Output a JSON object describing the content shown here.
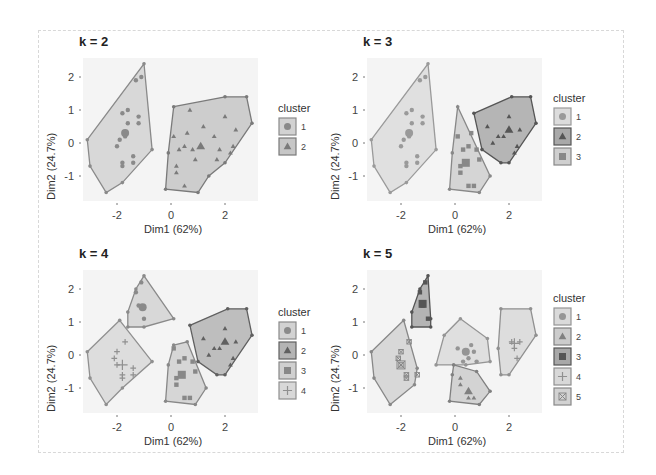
{
  "chart_data": [
    {
      "type": "scatter",
      "title": "k = 2",
      "xlabel": "Dim1 (62%)",
      "ylabel": "Dim2 (24.7%)",
      "xticks": [
        "-2",
        "0",
        "2"
      ],
      "yticks": [
        "2",
        "1",
        "0",
        "-1"
      ],
      "xlim": [
        -3.3,
        3.2
      ],
      "ylim": [
        -1.6,
        2.5
      ],
      "legend_title": "cluster",
      "legend": [
        "1",
        "2"
      ],
      "clusters": [
        {
          "name": "1",
          "shape": "circle",
          "fill": "#d2d2d2",
          "stroke": "#8a8a8a",
          "hull": [
            [
              -1,
              2.4
            ],
            [
              -0.7,
              -0.2
            ],
            [
              -1.8,
              -1.2
            ],
            [
              -2.4,
              -1.5
            ],
            [
              -3,
              -0.7
            ],
            [
              -3.1,
              0.1
            ]
          ],
          "points": [
            [
              -1.6,
              1
            ],
            [
              -1.8,
              0.9
            ],
            [
              -1.2,
              0.8
            ],
            [
              -1.6,
              0.6
            ],
            [
              -1.2,
              0.6
            ],
            [
              -1.7,
              0.2
            ],
            [
              -1.9,
              0.1
            ],
            [
              -2,
              -0.1
            ],
            [
              -1.4,
              -0.4
            ],
            [
              -1.4,
              -0.6
            ],
            [
              -1.8,
              -0.6
            ],
            [
              -1.8,
              -0.7
            ],
            [
              -1.1,
              2
            ],
            [
              -1.3,
              1.9
            ]
          ],
          "centroid": [
            -1.7,
            0.3
          ]
        },
        {
          "name": "2",
          "shape": "triangle",
          "fill": "#c6c6c6",
          "stroke": "#7a7a7a",
          "hull": [
            [
              0.1,
              1.1
            ],
            [
              2,
              1.4
            ],
            [
              2.8,
              1.4
            ],
            [
              3,
              0.6
            ],
            [
              2,
              -0.6
            ],
            [
              1.4,
              -1
            ],
            [
              1,
              -1.5
            ],
            [
              -0.2,
              -1.4
            ],
            [
              -0.1,
              -0.3
            ]
          ],
          "points": [
            [
              0.7,
              1
            ],
            [
              1.2,
              0.5
            ],
            [
              2,
              0.8
            ],
            [
              2.4,
              0.4
            ],
            [
              0.6,
              0.3
            ],
            [
              1.6,
              0.2
            ],
            [
              0.1,
              0.2
            ],
            [
              0.5,
              -0.1
            ],
            [
              1.8,
              -0.2
            ],
            [
              2.3,
              -0.1
            ],
            [
              0.3,
              -0.2
            ],
            [
              0.8,
              -0.2
            ],
            [
              0.9,
              -0.5
            ],
            [
              1.7,
              -0.5
            ],
            [
              0.2,
              -0.7
            ],
            [
              0.2,
              -0.9
            ],
            [
              0.5,
              -1.3
            ],
            [
              2.2,
              -0.3
            ]
          ],
          "centroid": [
            1.1,
            -0.1
          ]
        }
      ]
    },
    {
      "type": "scatter",
      "title": "k = 3",
      "xlabel": "Dim1 (62%)",
      "ylabel": "Dim2 (24.7%)",
      "xticks": [
        "-2",
        "0",
        "2"
      ],
      "yticks": [
        "2",
        "1",
        "0",
        "-1"
      ],
      "xlim": [
        -3.3,
        3.2
      ],
      "ylim": [
        -1.6,
        2.5
      ],
      "legend_title": "cluster",
      "legend": [
        "1",
        "2",
        "3"
      ],
      "clusters": [
        {
          "name": "1",
          "shape": "circle",
          "fill": "#dcdcdc",
          "stroke": "#9a9a9a",
          "hull": [
            [
              -1,
              2.4
            ],
            [
              -0.7,
              -0.2
            ],
            [
              -1.8,
              -1.2
            ],
            [
              -2.4,
              -1.5
            ],
            [
              -3,
              -0.7
            ],
            [
              -3.1,
              0.1
            ]
          ],
          "points": [
            [
              -1.6,
              1
            ],
            [
              -1.8,
              0.9
            ],
            [
              -1.2,
              0.8
            ],
            [
              -1.6,
              0.6
            ],
            [
              -1.2,
              0.6
            ],
            [
              -1.7,
              0.2
            ],
            [
              -1.9,
              0.1
            ],
            [
              -2,
              -0.1
            ],
            [
              -1.4,
              -0.4
            ],
            [
              -1.4,
              -0.6
            ],
            [
              -1.8,
              -0.6
            ],
            [
              -1.8,
              -0.7
            ],
            [
              -1.1,
              2
            ],
            [
              -1.3,
              1.9
            ]
          ],
          "centroid": [
            -1.7,
            0.3
          ]
        },
        {
          "name": "2",
          "shape": "triangle",
          "fill": "#a9a9a9",
          "stroke": "#555555",
          "hull": [
            [
              0.7,
              0.9
            ],
            [
              2.1,
              1.4
            ],
            [
              2.8,
              1.4
            ],
            [
              3,
              0.6
            ],
            [
              2,
              -0.6
            ],
            [
              1.7,
              -0.6
            ],
            [
              1,
              -0.2
            ]
          ],
          "points": [
            [
              2,
              0.8
            ],
            [
              1.2,
              0.5
            ],
            [
              2.4,
              0.4
            ],
            [
              1.6,
              0.2
            ],
            [
              1.8,
              0.2
            ],
            [
              2.3,
              -0.1
            ],
            [
              2.2,
              -0.3
            ],
            [
              1.4,
              0
            ]
          ],
          "centroid": [
            2,
            0.4
          ]
        },
        {
          "name": "3",
          "shape": "square",
          "fill": "#cfcfcf",
          "stroke": "#888888",
          "hull": [
            [
              0.1,
              1.1
            ],
            [
              1.3,
              -1
            ],
            [
              0.9,
              -1.5
            ],
            [
              -0.2,
              -1.4
            ],
            [
              -0.1,
              -0.3
            ]
          ],
          "points": [
            [
              0.1,
              0.2
            ],
            [
              0.6,
              0.3
            ],
            [
              0.5,
              -0.1
            ],
            [
              0.3,
              -0.2
            ],
            [
              0.8,
              -0.2
            ],
            [
              0.9,
              -0.5
            ],
            [
              0.2,
              -0.7
            ],
            [
              0.2,
              -0.9
            ],
            [
              0.5,
              -1.3
            ],
            [
              0.7,
              -1.3
            ]
          ],
          "centroid": [
            0.4,
            -0.6
          ]
        }
      ]
    },
    {
      "type": "scatter",
      "title": "k = 4",
      "xlabel": "Dim1 (62%)",
      "ylabel": "Dim2 (24.7%)",
      "xticks": [
        "-2",
        "0",
        "2"
      ],
      "yticks": [
        "2",
        "1",
        "0",
        "-1"
      ],
      "xlim": [
        -3.3,
        3.2
      ],
      "ylim": [
        -1.6,
        2.5
      ],
      "legend_title": "cluster",
      "legend": [
        "1",
        "2",
        "3",
        "4"
      ],
      "clusters": [
        {
          "name": "1",
          "shape": "circle",
          "fill": "#d2d2d2",
          "stroke": "#8a8a8a",
          "hull": [
            [
              -1,
              2.4
            ],
            [
              0.1,
              1.1
            ],
            [
              -1,
              0.85
            ],
            [
              -1.6,
              0.85
            ],
            [
              -1.6,
              1.3
            ],
            [
              -1.3,
              2.0
            ]
          ],
          "points": [
            [
              -1.2,
              1.5
            ],
            [
              -1.0,
              1.1
            ],
            [
              -1.3,
              1.9
            ],
            [
              -1.1,
              2.2
            ]
          ],
          "centroid": [
            -1.05,
            1.45
          ]
        },
        {
          "name": "2",
          "shape": "triangle",
          "fill": "#b4b4b4",
          "stroke": "#606060",
          "hull": [
            [
              0.7,
              0.9
            ],
            [
              2.1,
              1.4
            ],
            [
              2.8,
              1.4
            ],
            [
              3,
              0.6
            ],
            [
              2,
              -0.6
            ],
            [
              1.7,
              -0.6
            ],
            [
              1,
              -0.2
            ]
          ],
          "points": [
            [
              2,
              0.8
            ],
            [
              1.2,
              0.5
            ],
            [
              2.4,
              0.4
            ],
            [
              1.6,
              0.2
            ],
            [
              1.8,
              0.2
            ],
            [
              2.3,
              -0.1
            ],
            [
              2.2,
              -0.3
            ],
            [
              1.4,
              0
            ]
          ],
          "centroid": [
            2,
            0.4
          ]
        },
        {
          "name": "3",
          "shape": "square",
          "fill": "#d0d0d0",
          "stroke": "#888888",
          "hull": [
            [
              0.1,
              0.3
            ],
            [
              0.6,
              0.4
            ],
            [
              1.3,
              -1
            ],
            [
              0.9,
              -1.5
            ],
            [
              -0.2,
              -1.4
            ],
            [
              -0.1,
              -0.3
            ]
          ],
          "points": [
            [
              0.1,
              0.2
            ],
            [
              0.5,
              -0.1
            ],
            [
              0.3,
              -0.2
            ],
            [
              0.8,
              -0.2
            ],
            [
              0.9,
              -0.5
            ],
            [
              0.2,
              -0.7
            ],
            [
              0.2,
              -0.9
            ],
            [
              0.5,
              -1.3
            ],
            [
              0.7,
              -1.3
            ]
          ],
          "centroid": [
            0.4,
            -0.6
          ]
        },
        {
          "name": "4",
          "shape": "cross",
          "fill": "#d8d8d8",
          "stroke": "#909090",
          "hull": [
            [
              -1.9,
              1.05
            ],
            [
              -0.7,
              -0.2
            ],
            [
              -1.8,
              -1.0
            ],
            [
              -2.4,
              -1.5
            ],
            [
              -3,
              -0.7
            ],
            [
              -3.1,
              0.1
            ]
          ],
          "points": [
            [
              -1.7,
              0.4
            ],
            [
              -2,
              0.1
            ],
            [
              -2.1,
              -0.1
            ],
            [
              -1.4,
              -0.4
            ],
            [
              -1.4,
              -0.6
            ],
            [
              -1.8,
              -0.6
            ],
            [
              -1.8,
              -0.7
            ],
            [
              -2,
              -0.3
            ]
          ],
          "centroid": [
            -1.8,
            -0.3
          ]
        }
      ]
    },
    {
      "type": "scatter",
      "title": "k = 5",
      "xlabel": "Dim1 (62%)",
      "ylabel": "Dim2 (24.7%)",
      "xticks": [
        "-2",
        "0",
        "2"
      ],
      "yticks": [
        "2",
        "1",
        "0",
        "-1"
      ],
      "xlim": [
        -3.3,
        3.2
      ],
      "ylim": [
        -1.6,
        2.5
      ],
      "legend_title": "cluster",
      "legend": [
        "1",
        "2",
        "3",
        "4",
        "5"
      ],
      "clusters": [
        {
          "name": "1",
          "shape": "circle",
          "fill": "#dadada",
          "stroke": "#959595",
          "hull": [
            [
              0.2,
              1.1
            ],
            [
              1.2,
              0.5
            ],
            [
              1.3,
              -0.2
            ],
            [
              0.4,
              -0.3
            ],
            [
              -0.7,
              -0.3
            ],
            [
              -0.4,
              0.6
            ]
          ],
          "points": [
            [
              0.6,
              0.3
            ],
            [
              0.1,
              0.2
            ],
            [
              0.5,
              -0.1
            ],
            [
              0.3,
              -0.2
            ],
            [
              0.8,
              -0.2
            ],
            [
              0.7,
              0.1
            ]
          ],
          "centroid": [
            0.4,
            0.1
          ]
        },
        {
          "name": "2",
          "shape": "triangle",
          "fill": "#cccccc",
          "stroke": "#808080",
          "hull": [
            [
              -0.05,
              -0.3
            ],
            [
              0.8,
              -0.5
            ],
            [
              1.3,
              -1.1
            ],
            [
              0.9,
              -1.5
            ],
            [
              -0.2,
              -1.4
            ],
            [
              -0.1,
              -0.6
            ]
          ],
          "points": [
            [
              0.2,
              -0.7
            ],
            [
              0.2,
              -0.9
            ],
            [
              0.5,
              -1.3
            ],
            [
              0.7,
              -1.3
            ]
          ],
          "centroid": [
            0.5,
            -1.1
          ]
        },
        {
          "name": "3",
          "shape": "square",
          "fill": "#a8a8a8",
          "stroke": "#555555",
          "hull": [
            [
              -1,
              2.4
            ],
            [
              -0.9,
              1.1
            ],
            [
              -0.9,
              0.85
            ],
            [
              -1.6,
              0.85
            ],
            [
              -1.6,
              1.3
            ],
            [
              -1.3,
              2.0
            ]
          ],
          "points": [
            [
              -1.1,
              2.2
            ],
            [
              -1.3,
              1.9
            ],
            [
              -1.2,
              1.5
            ],
            [
              -1.0,
              1.1
            ]
          ],
          "centroid": [
            -1.2,
            1.55
          ]
        },
        {
          "name": "4",
          "shape": "cross",
          "fill": "#d8d8d8",
          "stroke": "#909090",
          "hull": [
            [
              1.7,
              1.4
            ],
            [
              2.8,
              1.4
            ],
            [
              3,
              0.6
            ],
            [
              2,
              -0.6
            ],
            [
              1.7,
              -0.6
            ],
            [
              1.6,
              0.2
            ]
          ],
          "points": [
            [
              2.4,
              0.4
            ],
            [
              2.1,
              0.4
            ],
            [
              2.3,
              -0.1
            ],
            [
              2.2,
              0.2
            ]
          ],
          "centroid": [
            2.2,
            0.35
          ]
        },
        {
          "name": "5",
          "shape": "x-square",
          "fill": "#d2d2d2",
          "stroke": "#888888",
          "hull": [
            [
              -1.9,
              1.05
            ],
            [
              -1.4,
              -0.4
            ],
            [
              -1.5,
              -0.9
            ],
            [
              -2.4,
              -1.5
            ],
            [
              -3,
              -0.7
            ],
            [
              -3.1,
              0.1
            ]
          ],
          "points": [
            [
              -2,
              0.1
            ],
            [
              -2.1,
              -0.1
            ],
            [
              -1.4,
              -0.6
            ],
            [
              -1.8,
              -0.6
            ],
            [
              -1.8,
              -0.7
            ],
            [
              -2,
              -0.3
            ],
            [
              -1.7,
              0.4
            ]
          ],
          "centroid": [
            -2,
            -0.3
          ]
        }
      ]
    }
  ]
}
